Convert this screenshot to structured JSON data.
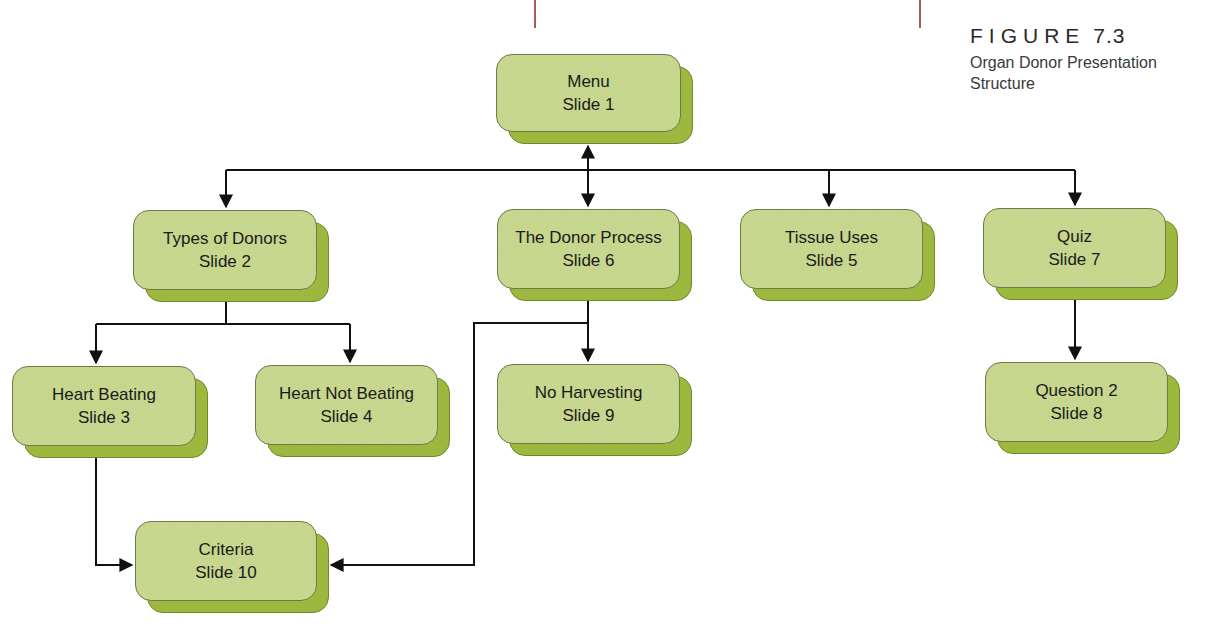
{
  "figure": {
    "label": "FIGURE",
    "number": "7.3",
    "title_line1": "Organ Donor Presentation",
    "title_line2": "Structure"
  },
  "colors": {
    "box_face": "#c6d68c",
    "box_shadow": "#9cb83e",
    "line": "#111111",
    "rule": "#a85a5a"
  },
  "nodes": [
    {
      "id": "menu",
      "title": "Menu",
      "slide": "Slide 1",
      "x": 496,
      "y": 54,
      "w": 185,
      "h": 78
    },
    {
      "id": "types",
      "title": "Types of Donors",
      "slide": "Slide 2",
      "x": 133,
      "y": 210,
      "w": 184,
      "h": 80
    },
    {
      "id": "process",
      "title": "The Donor Process",
      "slide": "Slide 6",
      "x": 497,
      "y": 209,
      "w": 183,
      "h": 80
    },
    {
      "id": "tissue",
      "title": "Tissue Uses",
      "slide": "Slide 5",
      "x": 740,
      "y": 209,
      "w": 183,
      "h": 80
    },
    {
      "id": "quiz",
      "title": "Quiz",
      "slide": "Slide 7",
      "x": 983,
      "y": 208,
      "w": 183,
      "h": 80
    },
    {
      "id": "heart-beating",
      "title": "Heart Beating",
      "slide": "Slide 3",
      "x": 12,
      "y": 366,
      "w": 184,
      "h": 80
    },
    {
      "id": "heart-not-beating",
      "title": "Heart Not Beating",
      "slide": "Slide 4",
      "x": 255,
      "y": 365,
      "w": 183,
      "h": 80
    },
    {
      "id": "no-harvesting",
      "title": "No Harvesting",
      "slide": "Slide 9",
      "x": 497,
      "y": 364,
      "w": 183,
      "h": 80
    },
    {
      "id": "question2",
      "title": "Question 2",
      "slide": "Slide 8",
      "x": 985,
      "y": 362,
      "w": 183,
      "h": 80
    },
    {
      "id": "criteria",
      "title": "Criteria",
      "slide": "Slide 10",
      "x": 135,
      "y": 521,
      "w": 182,
      "h": 80
    }
  ],
  "connections": [
    {
      "from": "menu",
      "to": "types",
      "bidirectional": false
    },
    {
      "from": "menu",
      "to": "process",
      "bidirectional": true
    },
    {
      "from": "menu",
      "to": "tissue",
      "bidirectional": false
    },
    {
      "from": "menu",
      "to": "quiz",
      "bidirectional": false
    },
    {
      "from": "types",
      "to": "heart-beating",
      "bidirectional": false
    },
    {
      "from": "types",
      "to": "heart-not-beating",
      "bidirectional": false
    },
    {
      "from": "process",
      "to": "no-harvesting",
      "bidirectional": false
    },
    {
      "from": "process",
      "to": "criteria",
      "bidirectional": false
    },
    {
      "from": "heart-beating",
      "to": "criteria",
      "bidirectional": false
    },
    {
      "from": "quiz",
      "to": "question2",
      "bidirectional": false
    }
  ]
}
